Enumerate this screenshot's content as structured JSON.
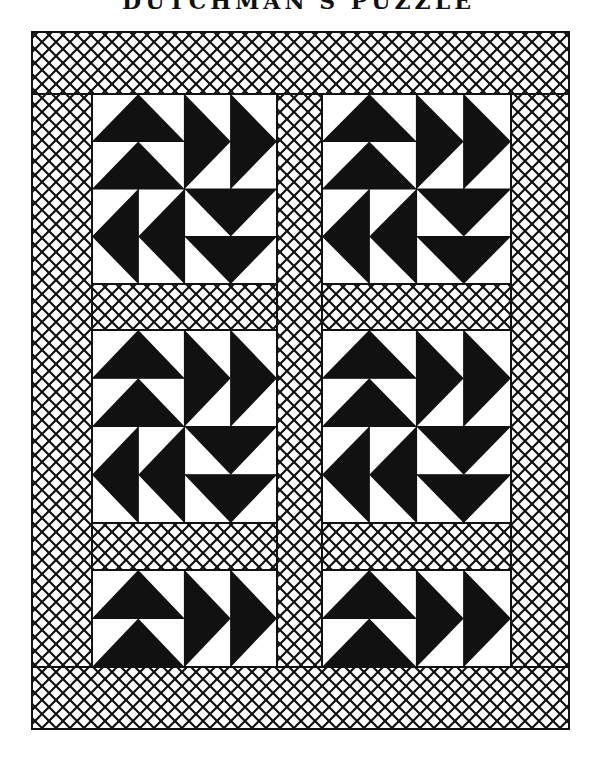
{
  "title": "DUTCHMAN'S PUZZLE",
  "colors": {
    "ink": "#111111",
    "paper": "#ffffff"
  },
  "quilt": {
    "outer": {
      "x": 32,
      "y": 32,
      "w": 537,
      "h": 697
    },
    "borders": {
      "top": {
        "x": 32,
        "y": 32,
        "w": 537,
        "h": 62
      },
      "bottom": {
        "x": 32,
        "y": 667,
        "w": 537,
        "h": 62
      },
      "left": {
        "x": 32,
        "y": 94,
        "w": 60,
        "h": 573
      },
      "right": {
        "x": 511,
        "y": 94,
        "w": 58,
        "h": 573
      }
    },
    "sashing": [
      {
        "name": "vertical-sashing",
        "x": 277,
        "y": 94,
        "w": 45,
        "h": 573
      },
      {
        "name": "horizontal-sashing-left-1",
        "x": 92,
        "y": 284,
        "w": 185,
        "h": 46
      },
      {
        "name": "horizontal-sashing-right-1",
        "x": 322,
        "y": 284,
        "w": 189,
        "h": 46
      },
      {
        "name": "horizontal-sashing-left-2",
        "x": 92,
        "y": 523,
        "w": 185,
        "h": 47
      },
      {
        "name": "horizontal-sashing-right-2",
        "x": 322,
        "y": 523,
        "w": 189,
        "h": 47
      }
    ],
    "blocks": [
      {
        "name": "block-row1-left",
        "x": 92,
        "y": 94,
        "w": 185,
        "h": 190,
        "type": "full"
      },
      {
        "name": "block-row1-right",
        "x": 322,
        "y": 94,
        "w": 189,
        "h": 190,
        "type": "full"
      },
      {
        "name": "block-row2-left",
        "x": 92,
        "y": 330,
        "w": 185,
        "h": 193,
        "type": "full"
      },
      {
        "name": "block-row2-right",
        "x": 322,
        "y": 330,
        "w": 189,
        "h": 193,
        "type": "full"
      },
      {
        "name": "block-row3-left",
        "x": 92,
        "y": 570,
        "w": 185,
        "h": 97,
        "type": "half"
      },
      {
        "name": "block-row3-right",
        "x": 322,
        "y": 570,
        "w": 189,
        "h": 97,
        "type": "half"
      }
    ],
    "lattice": {
      "pitch": 14,
      "stroke": 2.2
    },
    "pattern": "Dutchman's Puzzle: four quadrants of two flying-geese units each; TL geese point up, TR point right, BR point down, BL point left"
  }
}
